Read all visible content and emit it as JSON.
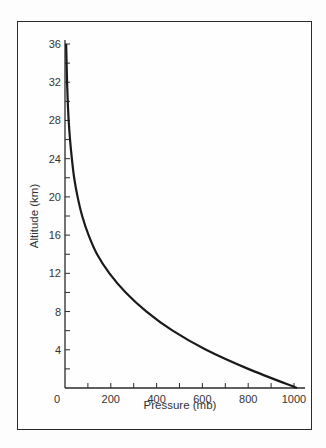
{
  "chart_data": {
    "type": "line",
    "title": "",
    "xlabel": "Pressure (mb)",
    "ylabel": "Altitude (km)",
    "xlim": [
      0,
      1000
    ],
    "ylim": [
      0,
      36
    ],
    "xticks": [
      0,
      200,
      400,
      600,
      800,
      1000
    ],
    "xtick_labels": [
      "0",
      "200",
      "400",
      "600",
      "800",
      "1000"
    ],
    "yticks": [
      4,
      8,
      12,
      16,
      20,
      24,
      28,
      32,
      36
    ],
    "ytick_labels": [
      "4",
      "8",
      "12",
      "16",
      "20",
      "24",
      "28",
      "32",
      "36"
    ],
    "grid": false,
    "legend": null,
    "series": [
      {
        "name": "Atmospheric pressure vs altitude",
        "x": [
          1013,
          800,
          616,
          470,
          356,
          265,
          194,
          140,
          103,
          75,
          55,
          40,
          30,
          22,
          16,
          12,
          9,
          7,
          5
        ],
        "y": [
          0,
          2,
          4,
          6,
          8,
          10,
          12,
          14,
          16,
          18,
          20,
          22,
          24,
          26,
          28,
          30,
          32,
          34,
          36
        ]
      }
    ],
    "color": "#1a1a1a"
  }
}
